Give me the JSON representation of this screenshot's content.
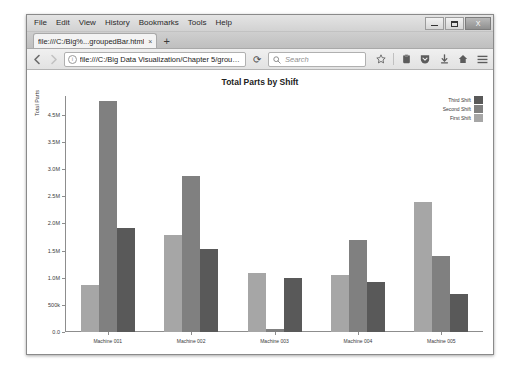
{
  "window": {
    "minimize_label": "Minimize",
    "maximize_label": "Maximize",
    "close_label": "X"
  },
  "menu": {
    "items": [
      {
        "label": "File"
      },
      {
        "label": "Edit"
      },
      {
        "label": "View"
      },
      {
        "label": "History"
      },
      {
        "label": "Bookmarks"
      },
      {
        "label": "Tools"
      },
      {
        "label": "Help"
      }
    ]
  },
  "tabs": {
    "items": [
      {
        "title": "file:///C:/Big%...groupedBar.html",
        "close": "×"
      }
    ],
    "new_tab_label": "+"
  },
  "navbar": {
    "back_icon": "back-arrow-icon",
    "forward_icon": "forward-arrow-icon",
    "url_value": "file:///C:/Big Data Visualization/Chapter 5/groupedBar.ht",
    "identity_icon": "info-circle-icon",
    "reload_label": "⟳",
    "search_placeholder": "Search",
    "search_icon": "search-icon",
    "icons": [
      {
        "name": "bookmark-star-icon",
        "glyph": "☆"
      },
      {
        "name": "reader-mode-icon",
        "glyph": "▤"
      },
      {
        "name": "pocket-shield-icon",
        "glyph": "♥"
      },
      {
        "name": "downloads-icon",
        "glyph": "⬇"
      },
      {
        "name": "home-icon",
        "glyph": "⌂"
      },
      {
        "name": "menu-hamburger-icon",
        "glyph": "☰"
      }
    ]
  },
  "chart_data": {
    "type": "bar",
    "title": "Total Parts by Shift",
    "xlabel": "",
    "ylabel": "Total Parts",
    "grid": false,
    "legend_position": "top-right",
    "categories": [
      "Machine 001",
      "Machine 002",
      "Machine 003",
      "Machine 004",
      "Machine 005"
    ],
    "ylim": [
      0,
      5000000
    ],
    "ytick_values": [
      0,
      500000,
      1000000,
      1500000,
      2000000,
      2500000,
      3000000,
      3500000,
      4500000
    ],
    "ytick_labels": [
      "0.0",
      "500k",
      "1.0M",
      "1.5M",
      "2.0M",
      "2.5M",
      "3.0M",
      "3.5M",
      "4.5M"
    ],
    "series": [
      {
        "name": "First Shift",
        "color": "#a6a6a6",
        "values": [
          1000000,
          2050000,
          1250000,
          1200000,
          2750000
        ]
      },
      {
        "name": "Second Shift",
        "color": "#808080",
        "values": [
          4900000,
          3300000,
          60000,
          1950000,
          1600000
        ]
      },
      {
        "name": "Third Shift",
        "color": "#595959",
        "values": [
          2200000,
          1750000,
          1150000,
          1050000,
          800000
        ]
      }
    ],
    "legend": [
      {
        "label": "Third Shift",
        "color": "#595959"
      },
      {
        "label": "Second Shift",
        "color": "#808080"
      },
      {
        "label": "First Shift",
        "color": "#a6a6a6"
      }
    ]
  }
}
